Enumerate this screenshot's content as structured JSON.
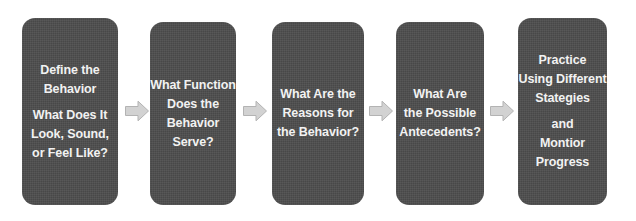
{
  "diagram": {
    "background_color": "#ffffff",
    "box_color": "#4d4d4d",
    "text_color": "#f2f2f2",
    "arrow_color": "#d2d2d2",
    "arrow_outline_color": "#b3b3b3",
    "steps": [
      {
        "id": "define-the-behavior",
        "lines_group_1": [
          "Define the",
          "Behavior"
        ],
        "lines_group_2": [
          "What Does It",
          "Look, Sound,",
          "or Feel Like?"
        ],
        "x": 22,
        "y": 18,
        "width": 96,
        "height": 187
      },
      {
        "id": "what-function-does-the-behavior-serve",
        "lines_group_1": [
          "What Function",
          "Does the",
          "Behavior",
          "Serve?"
        ],
        "lines_group_2": [],
        "x": 150,
        "y": 22,
        "width": 86,
        "height": 183
      },
      {
        "id": "what-are-the-reasons-for-the-behavior",
        "lines_group_1": [
          "What Are the",
          "Reasons for",
          "the Behavior?"
        ],
        "lines_group_2": [],
        "x": 272,
        "y": 22,
        "width": 92,
        "height": 183
      },
      {
        "id": "what-are-the-possible-antecedents",
        "lines_group_1": [
          "What Are",
          "the Possible",
          "Antecedents?"
        ],
        "lines_group_2": [],
        "x": 396,
        "y": 22,
        "width": 88,
        "height": 183
      },
      {
        "id": "practice-using-different-stategies-and-montior-progress",
        "lines_group_1": [
          "Practice",
          "Using Different",
          "Stategies"
        ],
        "lines_group_2": [
          "and",
          "Montior",
          "Progress"
        ],
        "x": 518,
        "y": 18,
        "width": 89,
        "height": 187
      }
    ],
    "arrows": [
      {
        "id": "arrow-1",
        "icon": "right-arrow-icon",
        "x": 124,
        "y": 98
      },
      {
        "id": "arrow-2",
        "icon": "right-arrow-icon",
        "x": 242,
        "y": 98
      },
      {
        "id": "arrow-3",
        "icon": "right-arrow-icon",
        "x": 368,
        "y": 98
      },
      {
        "id": "arrow-4",
        "icon": "right-arrow-icon",
        "x": 489,
        "y": 98
      }
    ]
  }
}
